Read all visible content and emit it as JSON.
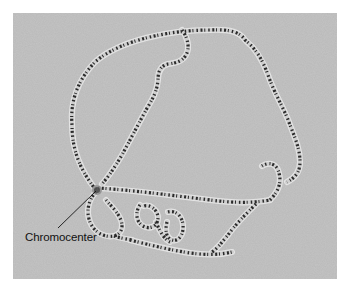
{
  "figure": {
    "background_color": "#b9b9b9",
    "band_color": "#2a2a2a",
    "halo_color": "#eeeeee",
    "annotations": [
      {
        "label": "Chromocenter",
        "pointer_from": [
          58,
          228
        ],
        "pointer_to": [
          96,
          191
        ]
      }
    ]
  }
}
